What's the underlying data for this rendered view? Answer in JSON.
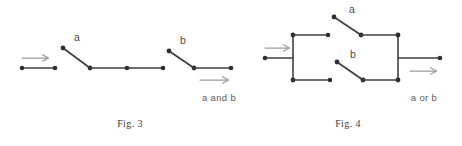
{
  "page": {
    "background_color": "#ffffff",
    "wire_color": "#3f3f46",
    "node_color": "#2e2e33",
    "arrow_color": "#9a9a9e",
    "label_color": "#4a4a50",
    "caption_color": "#3a3a40"
  },
  "figures": [
    {
      "id": "fig3",
      "caption": "Fig. 3",
      "expression": "a and b",
      "switches": [
        {
          "name": "a",
          "label": "a",
          "state": "open"
        },
        {
          "name": "b",
          "label": "b",
          "state": "open"
        }
      ],
      "topology": "series",
      "input_arrow": "→",
      "output_arrow": "→"
    },
    {
      "id": "fig4",
      "caption": "Fig. 4",
      "expression": "a or b",
      "switches": [
        {
          "name": "a",
          "label": "a",
          "state": "open"
        },
        {
          "name": "b",
          "label": "b",
          "state": "open"
        }
      ],
      "topology": "parallel",
      "input_arrow": "→",
      "output_arrow": "→"
    }
  ]
}
